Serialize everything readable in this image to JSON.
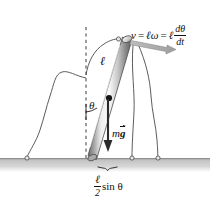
{
  "figure": {
    "background_color": "#ffffff",
    "width": 210,
    "height": 208
  },
  "labels": {
    "velocity_equation": {
      "v": "v",
      "equals_1": "=",
      "ell_omega": "ℓω",
      "equals_2": "=",
      "ell": "ℓ",
      "numerator": "dθ",
      "denominator": "dt"
    },
    "rod_length": "ℓ",
    "angle": "θ",
    "weight": "m",
    "weight_vector": "g",
    "base_extent": {
      "numerator": "ℓ",
      "denominator": "2",
      "trig": "sin θ"
    }
  },
  "colors": {
    "ground": "#b0b0b0",
    "rod_light": "#f2f2f2",
    "rod_mid": "#9a9a9a",
    "rod_dark": "#6e6e6e",
    "arrow_gray": "#9b9b9b",
    "arrow_black": "#2b2b2b",
    "ink": "#111111",
    "leader_line": "#4a4a4a"
  },
  "elements": {
    "ground_strip": "ground-strip",
    "vertical_dashed_reference": "vertical-reference-line",
    "rod": "rigid-rod",
    "center_of_mass_dot": "center-of-mass-dot",
    "velocity_arrow": "velocity-arrow",
    "weight_arrow": "weight-arrow",
    "angle_arc": "angle-arc",
    "base_brace": "base-brace",
    "leader_lines": [
      "leader-line-left",
      "leader-line-top",
      "leader-line-right-a",
      "leader-line-right-b"
    ]
  }
}
